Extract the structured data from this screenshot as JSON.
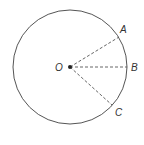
{
  "diagram": {
    "type": "circle-with-radii",
    "center": {
      "label": "O",
      "x": 70,
      "y": 67
    },
    "radius": 57,
    "points": [
      {
        "label": "A",
        "x": 119,
        "y": 37
      },
      {
        "label": "B",
        "x": 127,
        "y": 67
      },
      {
        "label": "C",
        "x": 112,
        "y": 105
      }
    ],
    "colors": {
      "stroke": "#555555",
      "text": "#333333",
      "dot": "#222222"
    }
  },
  "labels": {
    "O": "O",
    "A": "A",
    "B": "B",
    "C": "C"
  }
}
